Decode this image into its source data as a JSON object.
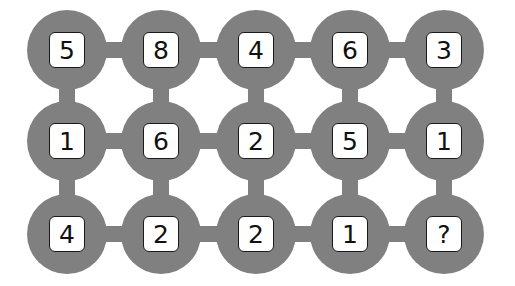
{
  "puzzle": {
    "colors": {
      "node": "#808080",
      "box": "#ffffff",
      "text": "#111111"
    },
    "columns_x": [
      67,
      161,
      256,
      350,
      444
    ],
    "rows_y": [
      50,
      141,
      234
    ],
    "grid": [
      [
        "5",
        "8",
        "4",
        "6",
        "3"
      ],
      [
        "1",
        "6",
        "2",
        "5",
        "1"
      ],
      [
        "4",
        "2",
        "2",
        "1",
        "?"
      ]
    ]
  }
}
